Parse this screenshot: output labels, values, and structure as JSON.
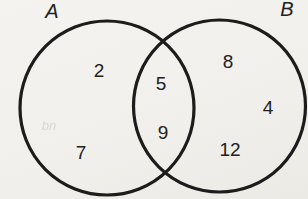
{
  "diagram": {
    "type": "venn",
    "set_a": {
      "label": "A",
      "only_values": [
        "2",
        "7"
      ]
    },
    "set_b": {
      "label": "B",
      "only_values": [
        "8",
        "4",
        "12"
      ]
    },
    "intersection_values": [
      "5",
      "9"
    ],
    "scan_smudge": "bn"
  },
  "colors": {
    "background": "#f1f0ec",
    "circle_stroke": "#1c1c1c",
    "text": "#212121"
  }
}
